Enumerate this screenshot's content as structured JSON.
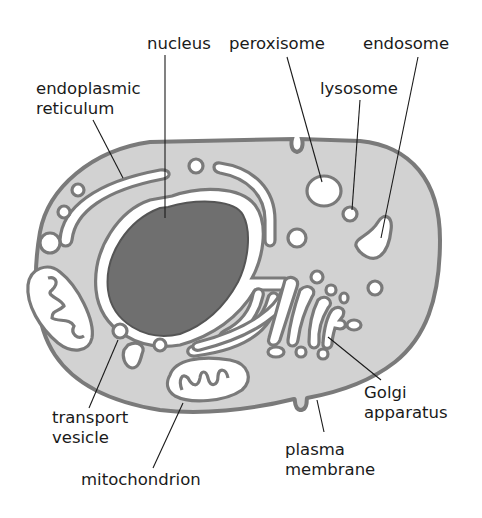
{
  "diagram": {
    "labels": {
      "nucleus": "nucleus",
      "peroxisome": "peroxisome",
      "endosome": "endosome",
      "lysosome": "lysosome",
      "er_line1": "endoplasmic",
      "er_line2": "reticulum",
      "transport_line1": "transport",
      "transport_line2": "vesicle",
      "mitochondrion": "mitochondrion",
      "golgi_line1": "Golgi",
      "golgi_line2": "apparatus",
      "plasma_line1": "plasma",
      "plasma_line2": "membrane"
    },
    "colors": {
      "cytoplasm": "#d2d2d2",
      "membrane": "#7a7a7a",
      "nucleus": "#6f6f6f",
      "lumen": "#ffffff",
      "text": "#1a1a1a"
    }
  }
}
